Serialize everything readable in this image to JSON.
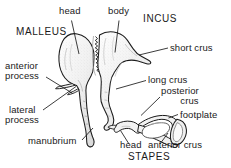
{
  "figure": {
    "bones": [
      "MALLEUS",
      "INCUS",
      "STAPES"
    ],
    "ink_color": "#1a1a1a",
    "fill_color": "#f4f4f4",
    "shade_color": "#c9c9c9",
    "background": "#ffffff"
  },
  "labels": {
    "head_malleus": "head",
    "body": "body",
    "incus": "INCUS",
    "malleus": "MALLEUS",
    "short_crus": "short crus",
    "anterior_process_l1": "anterior",
    "anterior_process_l2": "process",
    "long_crus": "long crus",
    "posterior_crus_l1": "posterior",
    "posterior_crus_l2": "crus",
    "lateral_process_l1": "lateral",
    "lateral_process_l2": "process",
    "footplate": "footplate",
    "manubrium": "manubrium",
    "head_stapes": "head",
    "anterior_crus": "anterior crus",
    "stapes": "STAPES"
  }
}
